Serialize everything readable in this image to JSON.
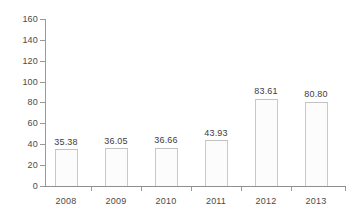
{
  "chart_data": {
    "type": "bar",
    "title": "",
    "subtitle": "",
    "xlabel": "",
    "ylabel": "",
    "categories": [
      "2008",
      "2009",
      "2010",
      "2011",
      "2012",
      "2013"
    ],
    "values": [
      35.38,
      36.05,
      36.66,
      43.93,
      83.61,
      80.8
    ],
    "value_labels": [
      "35.38",
      "36.05",
      "36.66",
      "43.93",
      "83.61",
      "80.80"
    ],
    "ylim": [
      0,
      160
    ],
    "ytick_step": 20,
    "yticks": [
      0,
      20,
      40,
      60,
      80,
      100,
      120,
      140,
      160
    ],
    "ytick_labels": [
      "0",
      "20",
      "40",
      "60",
      "80",
      "100",
      "120",
      "140",
      "160"
    ],
    "grid": false,
    "legend": null,
    "legend_position": "none",
    "series": [
      {
        "name": "",
        "values": [
          35.38,
          36.05,
          36.66,
          43.93,
          83.61,
          80.8
        ]
      }
    ],
    "colors": {
      "background": "#ffffff",
      "bar_fill": "#fcfcfc",
      "bar_border": "#c9c9c9",
      "axis": "#9a9a9a",
      "text": "#4a4a4a"
    }
  }
}
